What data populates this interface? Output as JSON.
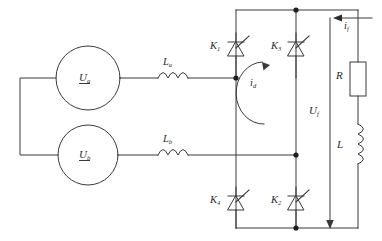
{
  "diagram": {
    "stroke_color": "#3a3a3a",
    "text_color": "#2b2b2b",
    "background": "#ffffff",
    "canvas": {
      "width": 382,
      "height": 241
    }
  },
  "sources": [
    {
      "name": "source-a",
      "label_main": "U",
      "label_sub": "a",
      "cx": 88,
      "cy": 78,
      "r": 32
    },
    {
      "name": "source-b",
      "label_main": "U",
      "label_sub": "b",
      "cx": 88,
      "cy": 155,
      "r": 30
    }
  ],
  "inductors": [
    {
      "name": "line-inductor-a",
      "label_main": "L",
      "label_sub": "a"
    },
    {
      "name": "line-inductor-b",
      "label_main": "L",
      "label_sub": "b"
    }
  ],
  "thyristors": [
    {
      "name": "thyristor-k1",
      "label_main": "K",
      "label_sub": "1",
      "position": "top-left"
    },
    {
      "name": "thyristor-k3",
      "label_main": "K",
      "label_sub": "3",
      "position": "top-right"
    },
    {
      "name": "thyristor-k4",
      "label_main": "K",
      "label_sub": "4",
      "position": "bottom-left"
    },
    {
      "name": "thyristor-k2",
      "label_main": "K",
      "label_sub": "2",
      "position": "bottom-right"
    }
  ],
  "currents": [
    {
      "name": "circulating-current",
      "label_main": "i",
      "label_sub": "d",
      "direction": "counter-clockwise-loop"
    },
    {
      "name": "load-current",
      "label_main": "i",
      "label_sub": "f",
      "direction": "leftward-arrow-top"
    }
  ],
  "voltages": [
    {
      "name": "output-voltage",
      "label_main": "U",
      "label_sub": "f",
      "direction": "downward-arrow"
    }
  ],
  "load": [
    {
      "name": "load-resistor",
      "label_main": "R",
      "label_sub": ""
    },
    {
      "name": "load-inductor",
      "label_main": "L",
      "label_sub": ""
    }
  ]
}
